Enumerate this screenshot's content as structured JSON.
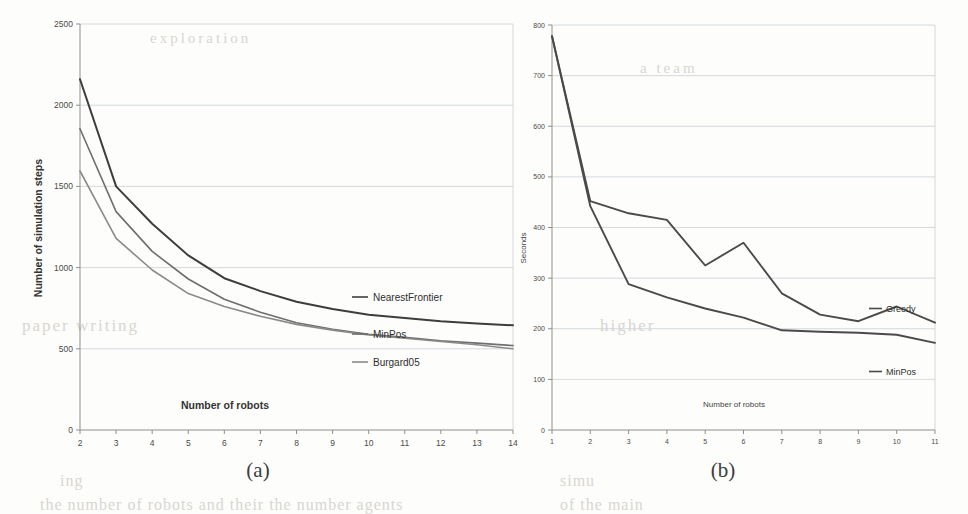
{
  "figure_a": {
    "caption": "(a)",
    "xlabel": "Number of robots",
    "ylabel": "Number of simulation steps",
    "legend": [
      "NearestFrontier",
      "MinPos",
      "Burgard05"
    ]
  },
  "figure_b": {
    "caption": "(b)",
    "xlabel": "Number of robots",
    "ylabel": "Seconds",
    "legend": [
      "Greedy",
      "MinPos"
    ]
  },
  "bleed_text": {
    "l1": "paper writing",
    "l2": "higher",
    "l3": "ing",
    "l4": "simu",
    "l5": "the number of robots and their the number agents",
    "l6": "of the main",
    "l7": "exploration",
    "l8": "a team"
  },
  "chart_data": [
    {
      "type": "line",
      "title": "(a)",
      "xlabel": "Number of robots",
      "ylabel": "Number of simulation steps",
      "x": [
        2,
        3,
        4,
        5,
        6,
        7,
        8,
        9,
        10,
        11,
        12,
        13,
        14
      ],
      "xlim": [
        2,
        14
      ],
      "ylim": [
        0,
        2500
      ],
      "yticks": [
        0,
        500,
        1000,
        1500,
        2000,
        2500
      ],
      "xticks": [
        2,
        3,
        4,
        5,
        6,
        7,
        8,
        9,
        10,
        11,
        12,
        13,
        14
      ],
      "grid": true,
      "legend_position": "right-inline",
      "series": [
        {
          "name": "NearestFrontier",
          "color": "#3d3d3d",
          "values": [
            2160,
            1500,
            1270,
            1075,
            935,
            855,
            790,
            745,
            710,
            690,
            670,
            655,
            645
          ]
        },
        {
          "name": "MinPos",
          "color": "#6e6e6e",
          "values": [
            1855,
            1345,
            1100,
            930,
            805,
            725,
            660,
            620,
            590,
            570,
            550,
            535,
            520
          ]
        },
        {
          "name": "Burgard05",
          "color": "#8a8a8a",
          "values": [
            1595,
            1180,
            985,
            840,
            760,
            700,
            650,
            615,
            585,
            565,
            545,
            525,
            500
          ]
        }
      ]
    },
    {
      "type": "line",
      "title": "(b)",
      "xlabel": "Number of robots",
      "ylabel": "Seconds",
      "x": [
        1,
        2,
        3,
        4,
        5,
        6,
        7,
        8,
        9,
        10,
        11
      ],
      "xlim": [
        1,
        11
      ],
      "ylim": [
        0,
        800
      ],
      "yticks": [
        0,
        100,
        200,
        300,
        400,
        500,
        600,
        700,
        800
      ],
      "xticks": [
        1,
        2,
        3,
        4,
        5,
        6,
        7,
        8,
        9,
        10,
        11
      ],
      "grid": true,
      "legend_position": "right-inline",
      "series": [
        {
          "name": "Greedy",
          "color": "#4a4a4a",
          "values": [
            778,
            452,
            428,
            415,
            325,
            370,
            270,
            228,
            215,
            244,
            212,
            210
          ]
        },
        {
          "name": "MinPos",
          "color": "#4a4a4a",
          "values": [
            778,
            442,
            288,
            262,
            240,
            222,
            197,
            194,
            192,
            188,
            172,
            150
          ]
        }
      ]
    }
  ]
}
